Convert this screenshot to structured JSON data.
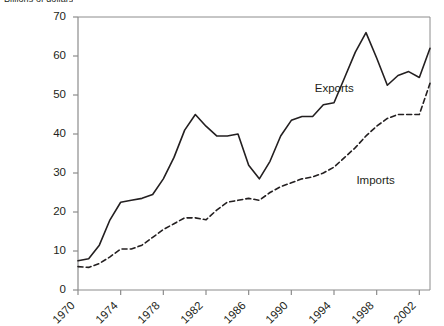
{
  "chart_data": {
    "type": "line",
    "title": "Billions of dollars",
    "xlabel": "",
    "ylabel": "",
    "ylim": [
      0,
      70
    ],
    "ytick_step": 10,
    "yticks": [
      0,
      10,
      20,
      30,
      40,
      50,
      60,
      70
    ],
    "xlim": [
      1970,
      2003
    ],
    "xticks": [
      1970,
      1974,
      1978,
      1982,
      1986,
      1990,
      1994,
      1998,
      2002
    ],
    "grid": false,
    "legend_position": "inline-annotation",
    "x": [
      1970,
      1971,
      1972,
      1973,
      1974,
      1975,
      1976,
      1977,
      1978,
      1979,
      1980,
      1981,
      1982,
      1983,
      1984,
      1985,
      1986,
      1987,
      1988,
      1989,
      1990,
      1991,
      1992,
      1993,
      1994,
      1995,
      1996,
      1997,
      1998,
      1999,
      2000,
      2001,
      2002,
      2003
    ],
    "series": [
      {
        "name": "Exports",
        "style": "solid",
        "color": "#231f20",
        "label_x": 1992.2,
        "label_y": 51.5,
        "values": [
          7.5,
          8.0,
          11.5,
          18.0,
          22.5,
          23.0,
          23.5,
          24.5,
          28.5,
          34.0,
          41.0,
          45.0,
          42.0,
          39.5,
          39.5,
          40.0,
          32.0,
          28.5,
          33.0,
          39.5,
          43.5,
          44.5,
          44.5,
          47.5,
          48.0,
          54.5,
          61.0,
          66.0,
          59.5,
          52.5,
          55.0,
          56.0,
          54.5,
          62.0
        ]
      },
      {
        "name": "Imports",
        "style": "dashed",
        "color": "#231f20",
        "label_x": 1996.1,
        "label_y": 28.0,
        "values": [
          6.0,
          5.8,
          6.8,
          8.5,
          10.5,
          10.5,
          11.5,
          13.5,
          15.5,
          17.0,
          18.5,
          18.5,
          18.0,
          20.5,
          22.5,
          23.0,
          23.5,
          23.0,
          25.0,
          26.5,
          27.5,
          28.5,
          29.0,
          30.0,
          31.5,
          34.0,
          36.5,
          39.5,
          42.0,
          44.0,
          45.0,
          45.0,
          45.0,
          53.0
        ]
      }
    ]
  },
  "axis": {
    "ytick_labels": [
      "70",
      "60",
      "50",
      "40",
      "30",
      "20",
      "10",
      "0"
    ],
    "xtick_labels": [
      "1970",
      "1974",
      "1978",
      "1982",
      "1986",
      "1990",
      "1994",
      "1998",
      "2002"
    ]
  }
}
